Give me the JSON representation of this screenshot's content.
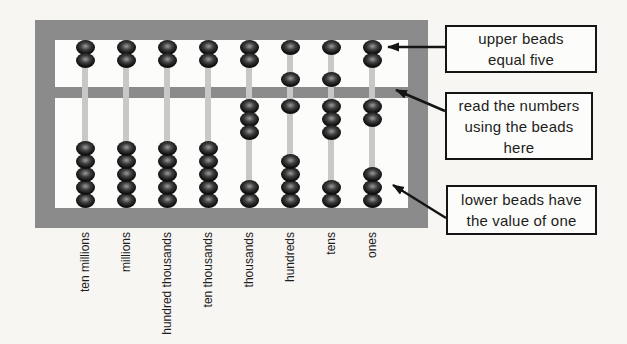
{
  "colors": {
    "background": "#f7f6f2",
    "inner_bg": "#fcfcfa",
    "frame": "#8b8b8b",
    "rod": "#c8c8c7",
    "bead_dark": "#101010",
    "bead_mid": "#3e3e3e",
    "bead_highlight": "#9a9a9a",
    "box_border": "#151515",
    "arrow": "#151515",
    "label_text": "#1c1c1c"
  },
  "abacus": {
    "upper_beads_per_rod": 2,
    "lower_beads_per_rod": 5,
    "columns": [
      {
        "label": "ten millions",
        "upper_beads_down": 0,
        "lower_beads_up": 0
      },
      {
        "label": "millions",
        "upper_beads_down": 0,
        "lower_beads_up": 0
      },
      {
        "label": "hundred thousands",
        "upper_beads_down": 0,
        "lower_beads_up": 0
      },
      {
        "label": "ten thousands",
        "upper_beads_down": 0,
        "lower_beads_up": 0
      },
      {
        "label": "thousands",
        "upper_beads_down": 0,
        "lower_beads_up": 3
      },
      {
        "label": "hundreds",
        "upper_beads_down": 1,
        "lower_beads_up": 1
      },
      {
        "label": "tens",
        "upper_beads_down": 1,
        "lower_beads_up": 3
      },
      {
        "label": "ones",
        "upper_beads_down": 0,
        "lower_beads_up": 2
      }
    ]
  },
  "callouts": [
    {
      "lines": [
        "upper beads",
        "equal five"
      ]
    },
    {
      "lines": [
        "read the numbers",
        "using the beads",
        "here"
      ]
    },
    {
      "lines": [
        "lower beads have",
        "the value of one"
      ]
    }
  ]
}
